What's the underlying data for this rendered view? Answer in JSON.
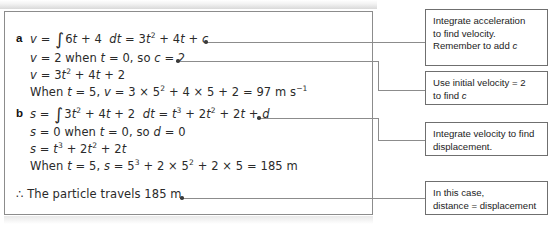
{
  "solution": {
    "parts": [
      {
        "label": "a",
        "lines": [
          {
            "id": "a1",
            "text": "v = ∫6t + 4  dt = 3t² + 4t + c"
          },
          {
            "id": "a2",
            "text": "v = 2 when t = 0, so c = 2"
          },
          {
            "id": "a3",
            "text": "v = 3t² + 4t + 2"
          },
          {
            "id": "a4",
            "text": "When t = 5, v = 3 × 5² + 4 × 5 + 2 = 97 m s⁻¹"
          }
        ]
      },
      {
        "label": "b",
        "lines": [
          {
            "id": "b1",
            "text": "s = ∫3t² + 4t + 2  dt = t³ + 2t² + 2t + d"
          },
          {
            "id": "b2",
            "text": "s = 0 when t = 0, so d = 0"
          },
          {
            "id": "b3",
            "text": "s = t³ + 2t² + 2t"
          },
          {
            "id": "b4",
            "text": "When t = 5, s = 5³ + 2 × 5² + 2 × 5 = 185 m"
          }
        ]
      }
    ],
    "conclusion": "∴ The particle travels 185 m"
  },
  "notes": [
    {
      "id": "note-integrate-acceleration",
      "lines": [
        "Integrate acceleration",
        "to find velocity.",
        "Remember to add c"
      ]
    },
    {
      "id": "note-use-initial-velocity",
      "lines": [
        "Use initial velocity = 2",
        "to find c"
      ]
    },
    {
      "id": "note-integrate-velocity",
      "lines": [
        "Integrate velocity to find",
        "displacement."
      ]
    },
    {
      "id": "note-distance-displacement",
      "lines": [
        "In this case,",
        "distance = displacement"
      ]
    }
  ],
  "colors": {
    "panel_border": "#8c8c8c",
    "note_border": "#6f6f6f",
    "text": "#231f20",
    "connector": "#8c8c8c"
  }
}
